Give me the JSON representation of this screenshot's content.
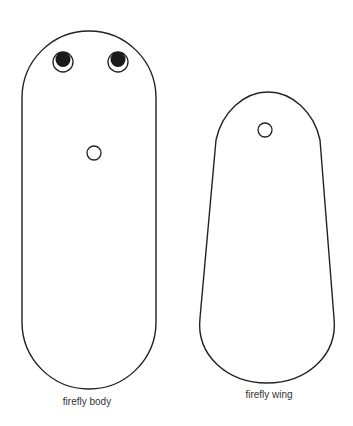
{
  "colors": {
    "stroke": "#222222",
    "fill": "#ffffff",
    "pupil": "#1a1a1a",
    "label": "#333333"
  },
  "pieces": [
    {
      "id": "body",
      "label": "firefly body",
      "features": [
        "left-eye",
        "right-eye",
        "center-hole"
      ]
    },
    {
      "id": "wing",
      "label": "firefly wing",
      "features": [
        "hole"
      ]
    }
  ]
}
